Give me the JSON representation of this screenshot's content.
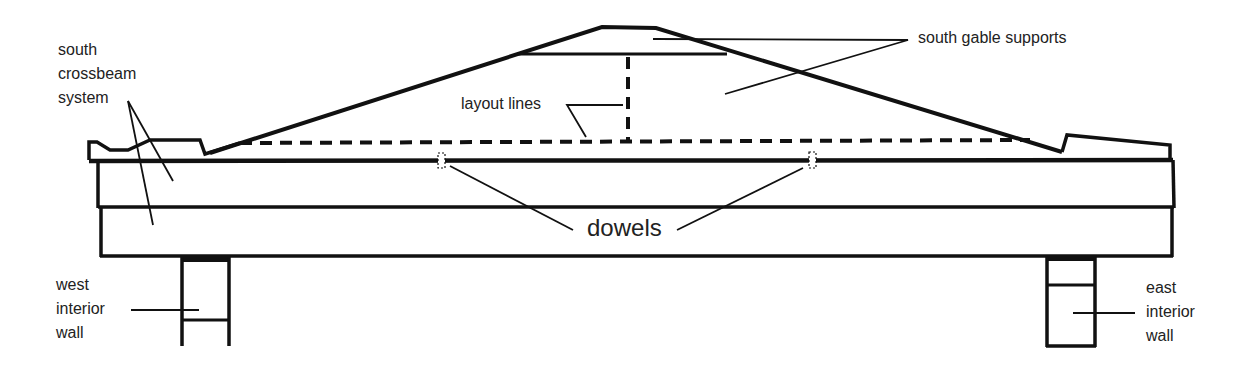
{
  "diagram": {
    "type": "technical cross-section",
    "colors": {
      "line": "#111111",
      "text": "#222222",
      "background": "#ffffff"
    },
    "labels": {
      "south_crossbeam_system": "south\ncrossbeam\nsystem",
      "south_gable_supports": "south gable supports",
      "layout_lines": "layout lines",
      "dowels": "dowels",
      "west_interior_wall": "west\ninterior\nwall",
      "east_interior_wall": "east\ninterior\nwall"
    },
    "components": [
      "south gable supports",
      "layout lines (dashed)",
      "upper crossbeam",
      "lower crossbeam",
      "dowels",
      "west interior wall",
      "east interior wall"
    ]
  }
}
